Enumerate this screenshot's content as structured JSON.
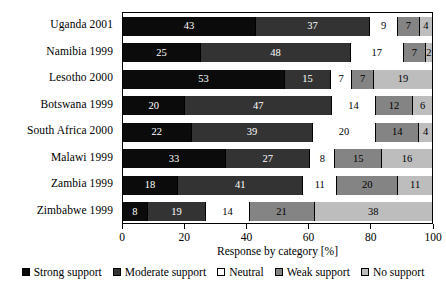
{
  "chart_data": {
    "type": "bar",
    "orientation": "horizontal",
    "stacked": true,
    "stack_mode": "percent",
    "title": "",
    "xlabel": "Response by category [%]",
    "ylabel": "",
    "xlim": [
      0,
      100
    ],
    "xticks": [
      0,
      20,
      40,
      60,
      80,
      100
    ],
    "xtick_labels": [
      "0",
      "20",
      "40",
      "60",
      "80",
      "100"
    ],
    "grid": false,
    "legend_position": "bottom",
    "categories": [
      "Uganda 2001",
      "Namibia 1999",
      "Lesotho 2000",
      "Botswana 1999",
      "South Africa 2000",
      "Malawi 1999",
      "Zambia 1999",
      "Zimbabwe 1999"
    ],
    "series": [
      {
        "name": "Strong support",
        "color": "#0b0b0b",
        "values": [
          43,
          25,
          53,
          20,
          22,
          33,
          18,
          8
        ]
      },
      {
        "name": "Moderate support",
        "color": "#333333",
        "values": [
          37,
          48,
          15,
          47,
          39,
          27,
          41,
          19
        ]
      },
      {
        "name": "Neutral",
        "color": "#ffffff",
        "values": [
          9,
          17,
          7,
          14,
          20,
          8,
          11,
          14
        ]
      },
      {
        "name": "Weak support",
        "color": "#848484",
        "values": [
          7,
          7,
          7,
          12,
          14,
          15,
          20,
          21
        ]
      },
      {
        "name": "No support",
        "color": "#bdbdbd",
        "values": [
          4,
          2,
          19,
          6,
          4,
          16,
          11,
          38
        ]
      }
    ]
  }
}
